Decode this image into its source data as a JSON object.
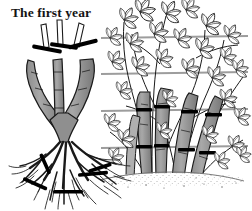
{
  "figure": {
    "title": "The first year",
    "medium": "pen-and-ink line illustration",
    "background_color": "#ffffff",
    "panels": [
      {
        "id": "left",
        "name": "bare-root-plant-with-pruning-marks",
        "description": "Bare-root cane fruit plant: three thick canes forming a V/Y trunk above a spreading fibrous root system. Bold black bars indicate where to cut the canes and the roots.",
        "cane_count": 3,
        "cut_mark_count_top": 3,
        "cut_mark_count_roots": 5
      },
      {
        "id": "right",
        "name": "established-canes-on-wire-supports",
        "description": "Established leafy canes trained against four horizontal support wires, thick gray canes tied at wire crossings, rising from stippled soil.",
        "wire_count": 4,
        "cane_count": 5,
        "ground_style": "stippled soil"
      }
    ],
    "colors": {
      "ink": "#1a1a1a",
      "cane_fill": "#9a9a9a",
      "cane_fill_light": "#b4b4b4",
      "cut_mark": "#000000",
      "wire": "#9d9d9d",
      "soil": "#6b6b6b",
      "paper": "#ffffff"
    },
    "wires_y": [
      38,
      73,
      110,
      147
    ],
    "soil_line_y": 178
  }
}
